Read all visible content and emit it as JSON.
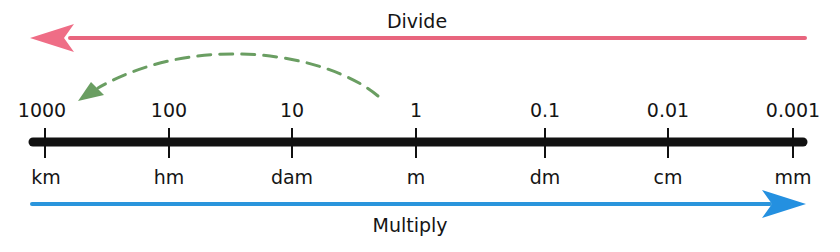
{
  "diagram": {
    "divide": {
      "label": "Divide",
      "direction": "left",
      "color": "#e8657e"
    },
    "multiply": {
      "label": "Multiply",
      "direction": "right",
      "color": "#2a95dc"
    },
    "example_arc": {
      "style": "dashed",
      "from": "1",
      "to": "1000",
      "color": "#6a9e62"
    },
    "number_line_color": "#111111",
    "ticks": [
      {
        "value": "1000",
        "unit": "km"
      },
      {
        "value": "100",
        "unit": "hm"
      },
      {
        "value": "10",
        "unit": "dam"
      },
      {
        "value": "1",
        "unit": "m"
      },
      {
        "value": "0.1",
        "unit": "dm"
      },
      {
        "value": "0.01",
        "unit": "cm"
      },
      {
        "value": "0.001",
        "unit": "mm"
      }
    ]
  }
}
